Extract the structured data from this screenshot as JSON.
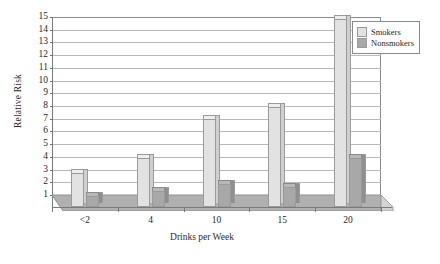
{
  "chart_data": {
    "type": "bar",
    "title": "",
    "xlabel": "Drinks per Week",
    "ylabel": "Relative Risk",
    "categories": [
      "<2",
      "4",
      "10",
      "15",
      "20"
    ],
    "series": [
      {
        "name": "Smokers",
        "color": "#e2e2e2",
        "values": [
          2.9,
          4.1,
          7.1,
          8.1,
          15.0
        ]
      },
      {
        "name": "Nonsmokers",
        "color": "#a8a8a8",
        "values": [
          1.1,
          1.5,
          2.0,
          1.8,
          4.1
        ]
      }
    ],
    "ylim": [
      1,
      15
    ],
    "yticks": [
      1,
      2,
      3,
      4,
      5,
      6,
      7,
      8,
      9,
      10,
      11,
      12,
      13,
      14,
      15
    ],
    "ytick_labels": [
      "1",
      "2",
      "3",
      "4",
      "5",
      "6",
      "7",
      "8",
      "9",
      "10",
      "11",
      "12",
      "13",
      "14",
      "15"
    ],
    "grid": true,
    "grid_axis": "y",
    "legend_position": "top-right",
    "style": "3d-column"
  },
  "axes": {
    "y_title": "Relative Risk",
    "x_title": "Drinks per Week"
  },
  "legend": {
    "entries": [
      {
        "label": "Smokers",
        "swatch": "smokers"
      },
      {
        "label": "Nonsmokers",
        "swatch": "nonsmokers"
      }
    ]
  },
  "colors": {
    "smokers": "#e2e2e2",
    "nonsmokers": "#a8a8a8",
    "gridline": "#b9b9b9",
    "axis": "#7a7a7a",
    "floor": "#b0b0b0"
  }
}
